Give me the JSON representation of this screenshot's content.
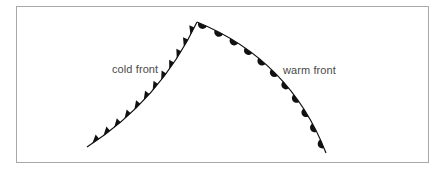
{
  "diagram": {
    "labels": {
      "cold_front": "cold front",
      "warm_front": "warm front"
    },
    "colors": {
      "line": "#111111",
      "symbol": "#111111",
      "border": "#a8a8a8",
      "label": "#4a4a4a"
    },
    "fronts": [
      {
        "name": "cold front",
        "type": "cold",
        "symbol": "triangle",
        "start": [
          87,
          147
        ],
        "control": [
          160,
          100
        ],
        "end": [
          197,
          22
        ],
        "symbol_count": 12
      },
      {
        "name": "warm front",
        "type": "warm",
        "symbol": "semicircle",
        "start": [
          197,
          22
        ],
        "control": [
          290,
          60
        ],
        "end": [
          326,
          153
        ],
        "symbol_count": 11
      }
    ]
  }
}
